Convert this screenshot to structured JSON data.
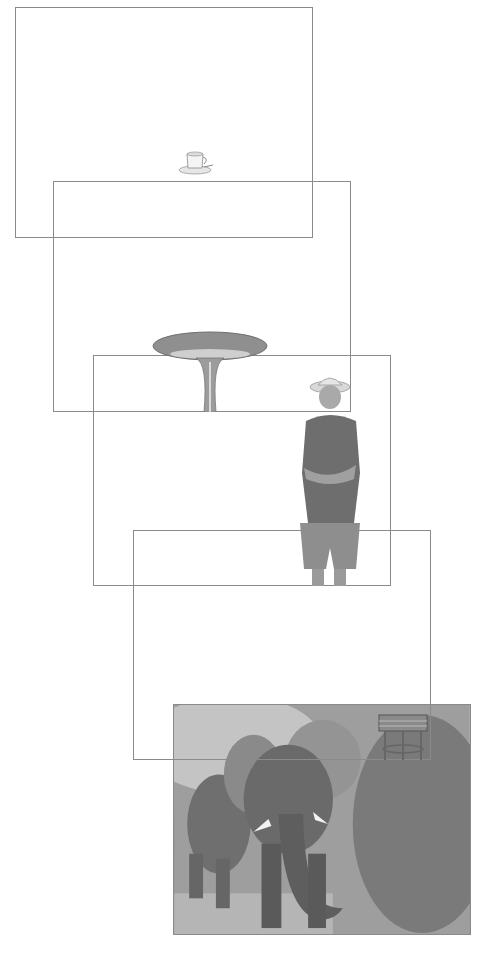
{
  "canvas": {
    "width": 487,
    "height": 960,
    "background": "#ffffff"
  },
  "frame_border_color": "#8a8a8a",
  "layers": [
    {
      "id": 1,
      "content": "coffee-cup",
      "x": 15,
      "y": 7,
      "w": 298,
      "h": 231
    },
    {
      "id": 2,
      "content": "round-table",
      "x": 53,
      "y": 181,
      "w": 298,
      "h": 231
    },
    {
      "id": 3,
      "content": "man-in-hat",
      "x": 93,
      "y": 355,
      "w": 298,
      "h": 231
    },
    {
      "id": 4,
      "content": "stool",
      "x": 133,
      "y": 530,
      "w": 298,
      "h": 230
    },
    {
      "id": 5,
      "content": "elephants-photo",
      "x": 173,
      "y": 704,
      "w": 298,
      "h": 231
    }
  ]
}
